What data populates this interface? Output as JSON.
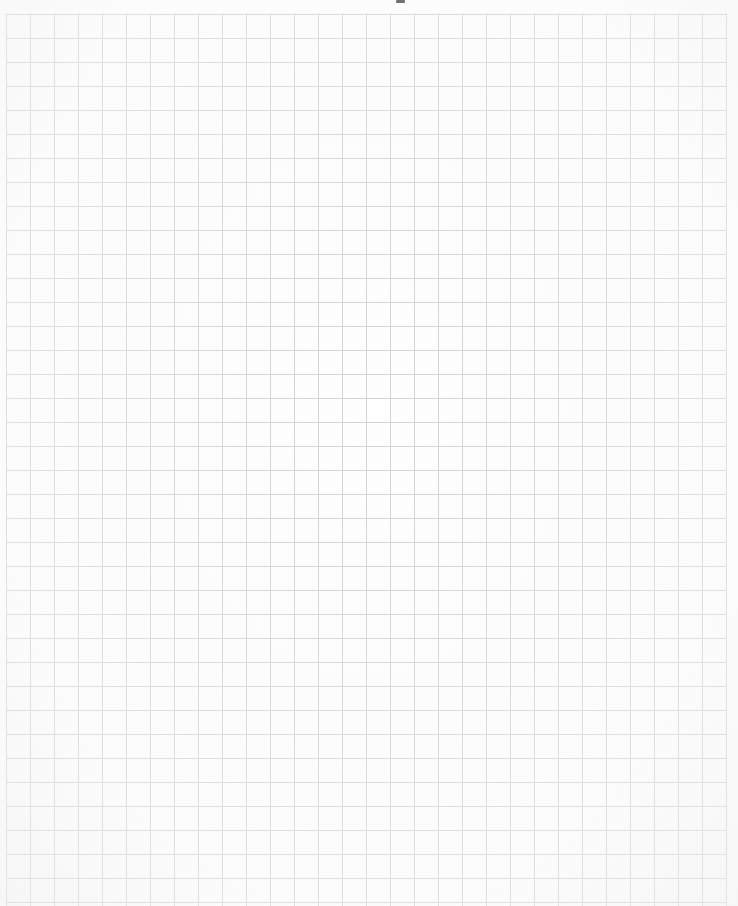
{
  "document": {
    "kind": "scanned-graph-paper",
    "title": "Graph Paper Sheet",
    "text_content": "",
    "page_width_px": 738,
    "page_height_px": 906
  },
  "paper": {
    "background_color": "#ffffff",
    "surface_color": "#fefefe",
    "grid_line_color": "#d2d3d5"
  },
  "grid": {
    "cell_width_px": 24,
    "cell_height_px": 24,
    "line_width_px": 1,
    "first_vertical_line_x": 6,
    "first_horizontal_line_y": 14,
    "last_vertical_line_x": 726,
    "columns": 30,
    "rows": 38,
    "left_margin_px": 6,
    "top_margin_px": 13,
    "right_margin_px": 11
  },
  "artifacts": {
    "top_smudge": {
      "name": "scan-smudge",
      "x": 396,
      "y": 0,
      "width": 9,
      "height": 3,
      "color": "#2e2e2e"
    }
  }
}
